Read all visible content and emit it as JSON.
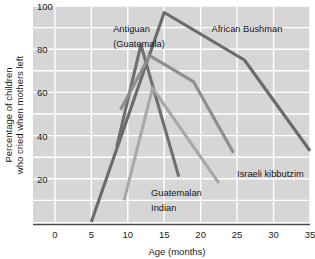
{
  "chart_data": {
    "type": "line",
    "title": "",
    "xlabel": "Age (months)",
    "ylabel": "Percentage of children who cried when mothers left",
    "ylabel_line1": "Percentage of children",
    "ylabel_line2": "who cried when mothers left",
    "xlim": [
      -3,
      35
    ],
    "ylim": [
      0,
      100
    ],
    "xticks": [
      0,
      5,
      10,
      15,
      20,
      25,
      30,
      35
    ],
    "xtick_labels": [
      "0",
      "5",
      "10",
      "15",
      "20",
      "25",
      "30",
      "35"
    ],
    "yticks": [
      20,
      40,
      60,
      80,
      100
    ],
    "ytick_labels": [
      "20",
      "40",
      "60",
      "80",
      "100"
    ],
    "y_gridlines": [
      10,
      20,
      30,
      40,
      50,
      60,
      70,
      80,
      90,
      100
    ],
    "x_gridlines": [
      0,
      5,
      10,
      15,
      20,
      25,
      30,
      35
    ],
    "grid": true,
    "grid_color": "#ffffff",
    "plot_background": "#d6d6d6",
    "legend": "annotations-on-plot",
    "series": [
      {
        "name": "African Bushman",
        "color": "#6b6b6b",
        "points": [
          [
            5,
            0
          ],
          [
            15,
            97
          ],
          [
            26,
            75
          ],
          [
            35,
            33
          ]
        ]
      },
      {
        "name": "Antiguan (Guatemala)",
        "color": "#6f6f6f",
        "points": [
          [
            8.5,
            35
          ],
          [
            11.8,
            82
          ],
          [
            17,
            21
          ]
        ]
      },
      {
        "name": "Israeli kibbutzim",
        "color": "#8e8e8e",
        "points": [
          [
            9,
            52
          ],
          [
            13,
            77
          ],
          [
            19,
            65
          ],
          [
            24.5,
            32
          ]
        ]
      },
      {
        "name": "Guatemalan Indian",
        "color": "#a8a8a8",
        "points": [
          [
            9.5,
            10
          ],
          [
            13.4,
            62
          ],
          [
            22.5,
            18
          ]
        ]
      }
    ],
    "annotations": [
      {
        "text": "Antiguan",
        "x": 8.0,
        "y": 88
      },
      {
        "text": "(Guatemala)",
        "x": 8.0,
        "y": 81
      },
      {
        "text": "African Bushman",
        "x": 21.5,
        "y": 88
      },
      {
        "text": "Israeli kibbutzim",
        "x": 25.0,
        "y": 21
      },
      {
        "text": "Guatemalan",
        "x": 13.2,
        "y": 12
      },
      {
        "text": "Indian",
        "x": 13.2,
        "y": 5
      }
    ]
  }
}
